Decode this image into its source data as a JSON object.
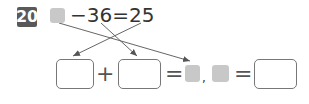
{
  "problem": {
    "number": "20",
    "equation": {
      "minus": "−36=25"
    },
    "row2": {
      "plus": "+",
      "equals1": "=",
      "comma": ",",
      "equals2": "="
    }
  },
  "colors": {
    "badge": "#595959",
    "placeholder_box": "#c8c8c8",
    "arrow": "#555555"
  }
}
